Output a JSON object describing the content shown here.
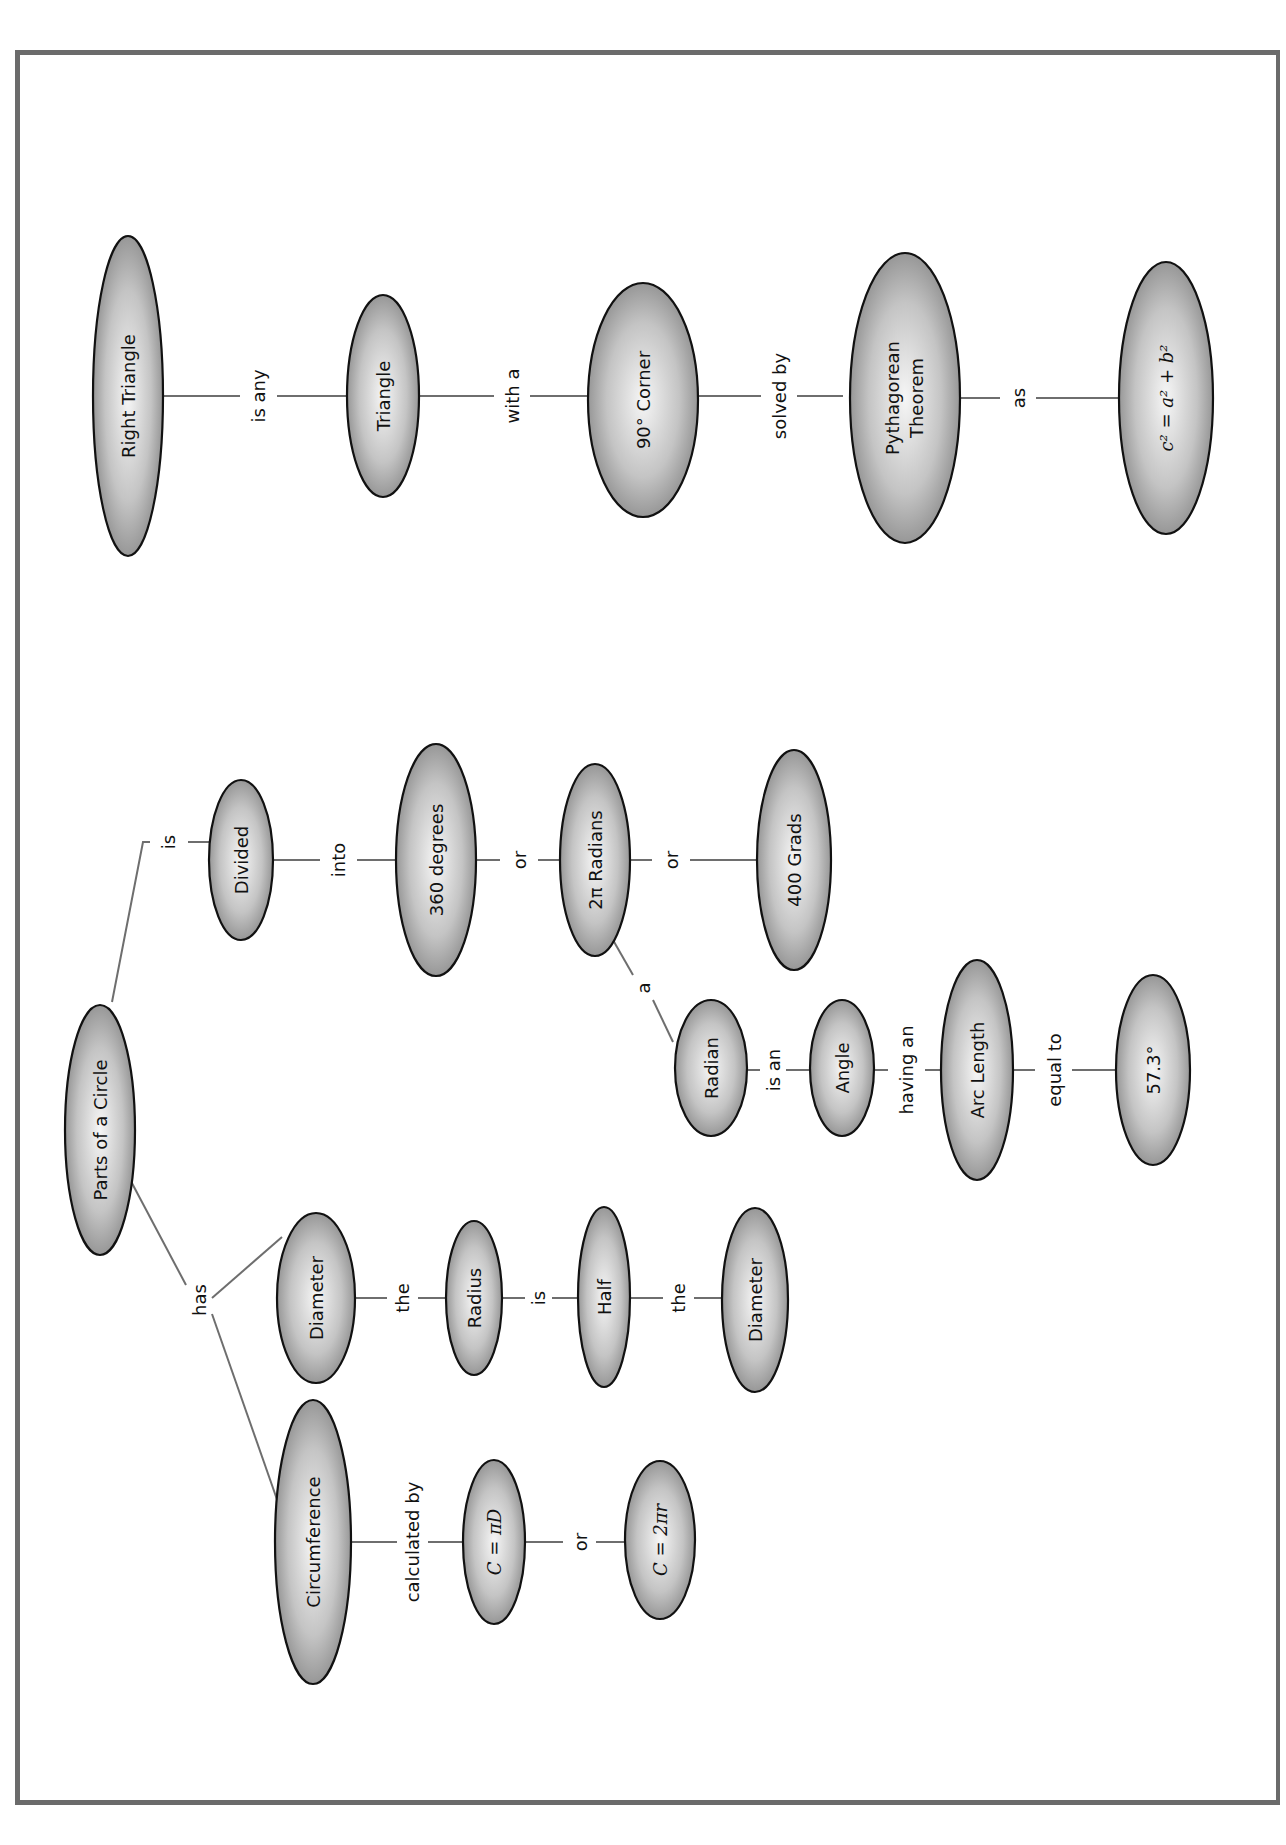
{
  "diagram": {
    "orientation": "rotated 90° counter-clockwise",
    "colors": {
      "frame": "#6b6b6b",
      "edge": "#6e6e6e",
      "node_dark": "#8a8a8a",
      "node_light": "#f4f4f4",
      "outline": "#111111"
    },
    "nodes": {
      "parts_of_circle": "Parts of a Circle",
      "circumference": "Circumference",
      "diameter": "Diameter",
      "c_pi_d": "C = πD",
      "c_2pi_r": "C = 2πr",
      "radius": "Radius",
      "half": "Half",
      "diameter2": "Diameter",
      "divided": "Divided",
      "deg360": "360 degrees",
      "rad2pi": "2π Radians",
      "grads400": "400 Grads",
      "radian": "Radian",
      "angle": "Angle",
      "arc_length": "Arc Length",
      "deg573": "57.3°",
      "right_triangle": "Right Triangle",
      "triangle": "Triangle",
      "corner90": "90° Corner",
      "pythag_1": "Pythagorean",
      "pythag_2": "Theorem",
      "formula": "c² = a² + b²"
    },
    "links": {
      "has": "has",
      "is_divided": "is",
      "calculated_by": "calculated by",
      "or_c": "or",
      "the_1": "the",
      "is_half": "is",
      "the_2": "the",
      "into": "into",
      "or_1": "or",
      "or_2": "or",
      "a": "a",
      "is_an": "is an",
      "having_an": "having an",
      "equal_to": "equal to",
      "is_any": "is any",
      "with_a": "with a",
      "solved_by": "solved by",
      "as": "as"
    }
  }
}
